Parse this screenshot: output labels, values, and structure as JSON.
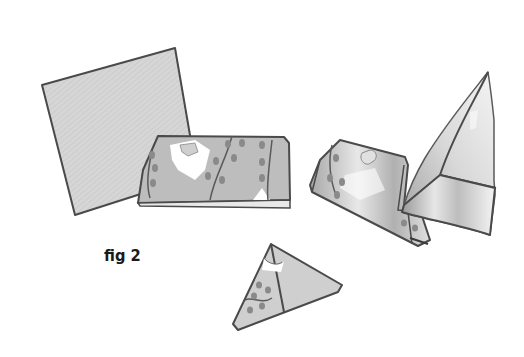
{
  "figure": {
    "caption": "fig 2",
    "steps": [
      {
        "name": "plain-square-napkin",
        "shading": "#d4d4d4"
      },
      {
        "name": "folded-patterned-band",
        "shading": "#bdbdbd"
      },
      {
        "name": "folded-corner-piece",
        "shading": "#c8c8c8"
      },
      {
        "name": "standing-cone-fold",
        "shading": "#cfcfcf"
      },
      {
        "name": "small-triangle-fold",
        "shading": "#c4c4c4"
      }
    ],
    "colors": {
      "outline": "#4a4a4a",
      "paper_light": "#d9d9d9",
      "paper_mid": "#bdbdbd",
      "pattern_leaf": "#8a8a8a",
      "highlight": "#ffffff",
      "text": "#1a1a1a"
    }
  }
}
